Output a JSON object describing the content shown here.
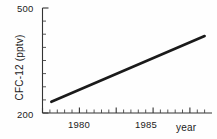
{
  "figure": {
    "name": "cfc-12-trend-plot",
    "background": "#fefefe",
    "ink_color": "#222222",
    "line_color": "#1a1a1a"
  },
  "chart_data": {
    "type": "line",
    "title": "",
    "xlabel": "year",
    "ylabel": "CFC-12 (pptv)",
    "xlim": [
      1977,
      1988.5
    ],
    "ylim": [
      200,
      500
    ],
    "xticks_labeled": [
      1980,
      1985
    ],
    "xtick_labels": [
      "1980",
      "1985"
    ],
    "yticks_labeled": [
      200,
      500
    ],
    "ytick_labels": [
      "200",
      "500"
    ],
    "x_minor_tick_step": 0.5,
    "y_minor_tick_step": 25,
    "grid": false,
    "legend": null,
    "series": [
      {
        "name": "CFC-12 mixing ratio",
        "x": [
          1977.6,
          1988.0
        ],
        "values": [
          232,
          420
        ],
        "line_width": 2.6,
        "style": "solid"
      }
    ],
    "annotations": []
  },
  "labels": {
    "y_axis_title": "CFC-12 (pptv)",
    "y_top": "500",
    "y_bottom": "200",
    "x_1980": "1980",
    "x_1985": "1985",
    "x_axis_title": "year"
  }
}
